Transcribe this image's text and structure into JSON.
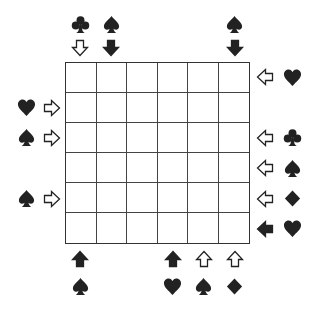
{
  "puzzle": {
    "type": "suit-arrow-grid",
    "rows": 6,
    "cols": 6,
    "cells": [
      [
        "",
        "",
        "",
        "",
        "",
        ""
      ],
      [
        "",
        "",
        "",
        "",
        "",
        ""
      ],
      [
        "",
        "",
        "",
        "",
        "",
        ""
      ],
      [
        "",
        "",
        "",
        "",
        "",
        ""
      ],
      [
        "",
        "",
        "",
        "",
        "",
        ""
      ],
      [
        "",
        "",
        "",
        "",
        "",
        ""
      ]
    ]
  },
  "colors": {
    "ink": "#222222",
    "grid_line": "#444444",
    "background": "#ffffff"
  },
  "clues": {
    "top": [
      {
        "col": 0,
        "suit": "club",
        "arrow": "down",
        "arrow_fill": "white"
      },
      {
        "col": 1,
        "suit": "spade",
        "arrow": "down",
        "arrow_fill": "black"
      },
      {
        "col": 5,
        "suit": "spade",
        "arrow": "down",
        "arrow_fill": "black"
      }
    ],
    "left": [
      {
        "row": 1,
        "suit": "heart",
        "arrow": "right",
        "arrow_fill": "white"
      },
      {
        "row": 2,
        "suit": "spade",
        "arrow": "right",
        "arrow_fill": "white"
      },
      {
        "row": 4,
        "suit": "spade",
        "arrow": "right",
        "arrow_fill": "white"
      }
    ],
    "right": [
      {
        "row": 0,
        "suit": "heart",
        "arrow": "left",
        "arrow_fill": "white"
      },
      {
        "row": 2,
        "suit": "club",
        "arrow": "left",
        "arrow_fill": "white"
      },
      {
        "row": 3,
        "suit": "spade",
        "arrow": "left",
        "arrow_fill": "white"
      },
      {
        "row": 4,
        "suit": "diamond",
        "arrow": "left",
        "arrow_fill": "white"
      },
      {
        "row": 5,
        "suit": "heart",
        "arrow": "left",
        "arrow_fill": "black"
      }
    ],
    "bottom": [
      {
        "col": 0,
        "suit": "spade",
        "arrow": "up",
        "arrow_fill": "black"
      },
      {
        "col": 3,
        "suit": "heart",
        "arrow": "up",
        "arrow_fill": "black"
      },
      {
        "col": 4,
        "suit": "spade",
        "arrow": "up",
        "arrow_fill": "white"
      },
      {
        "col": 5,
        "suit": "diamond",
        "arrow": "up",
        "arrow_fill": "white"
      }
    ]
  }
}
